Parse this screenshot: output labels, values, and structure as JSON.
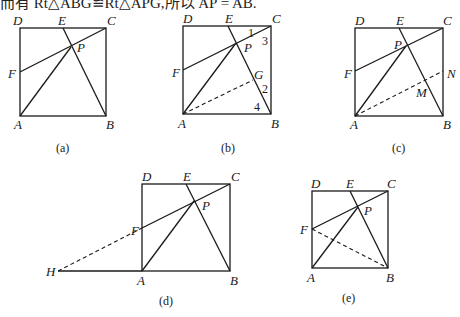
{
  "top_text": "而有 Rt△ABG≌Rt△APG,所以 AP = AB.",
  "figures": [
    {
      "id": "a",
      "caption": "(a)",
      "points": {
        "A": [
          20,
          116
        ],
        "B": [
          106,
          116
        ],
        "C": [
          106,
          28
        ],
        "D": [
          20,
          28
        ],
        "E": [
          63,
          28
        ],
        "F": [
          20,
          72
        ],
        "P": [
          71,
          47
        ]
      },
      "labels": {
        "A": "A",
        "B": "B",
        "C": "C",
        "D": "D",
        "E": "E",
        "F": "F",
        "P": "P"
      }
    },
    {
      "id": "b",
      "caption": "(b)",
      "points": {
        "A": [
          183,
          114
        ],
        "B": [
          271,
          114
        ],
        "C": [
          271,
          26
        ],
        "D": [
          183,
          26
        ],
        "E": [
          228,
          26
        ],
        "F": [
          183,
          70
        ],
        "P": [
          236,
          43
        ],
        "G": [
          253,
          80
        ]
      },
      "labels": {
        "A": "A",
        "B": "B",
        "C": "C",
        "D": "D",
        "E": "E",
        "F": "F",
        "P": "P",
        "G": "G"
      },
      "angle_labels": [
        "1",
        "2",
        "3",
        "4"
      ]
    },
    {
      "id": "c",
      "caption": "(c)",
      "points": {
        "A": [
          355,
          116
        ],
        "B": [
          443,
          116
        ],
        "C": [
          443,
          28
        ],
        "D": [
          355,
          28
        ],
        "E": [
          399,
          28
        ],
        "F": [
          355,
          71
        ],
        "P": [
          406,
          46
        ],
        "N": [
          443,
          71
        ],
        "M": [
          424,
          80
        ]
      },
      "labels": {
        "A": "A",
        "B": "B",
        "C": "C",
        "D": "D",
        "E": "E",
        "F": "F",
        "P": "P",
        "N": "N",
        "M": "M"
      }
    },
    {
      "id": "d",
      "caption": "(d)",
      "points": {
        "A": [
          142,
          271
        ],
        "B": [
          230,
          271
        ],
        "C": [
          230,
          184
        ],
        "D": [
          142,
          184
        ],
        "E": [
          186,
          184
        ],
        "F": [
          142,
          228
        ],
        "P": [
          194,
          201
        ],
        "H": [
          58,
          271
        ]
      },
      "labels": {
        "A": "A",
        "B": "B",
        "C": "C",
        "D": "D",
        "E": "E",
        "F": "F",
        "P": "P",
        "H": "H"
      }
    },
    {
      "id": "e",
      "caption": "(e)",
      "points": {
        "A": [
          312,
          268
        ],
        "B": [
          388,
          268
        ],
        "C": [
          388,
          191
        ],
        "D": [
          312,
          191
        ],
        "E": [
          350,
          191
        ],
        "F": [
          312,
          229
        ],
        "P": [
          358,
          207
        ]
      },
      "labels": {
        "A": "A",
        "B": "B",
        "C": "C",
        "D": "D",
        "E": "E",
        "F": "F",
        "P": "P"
      }
    }
  ]
}
